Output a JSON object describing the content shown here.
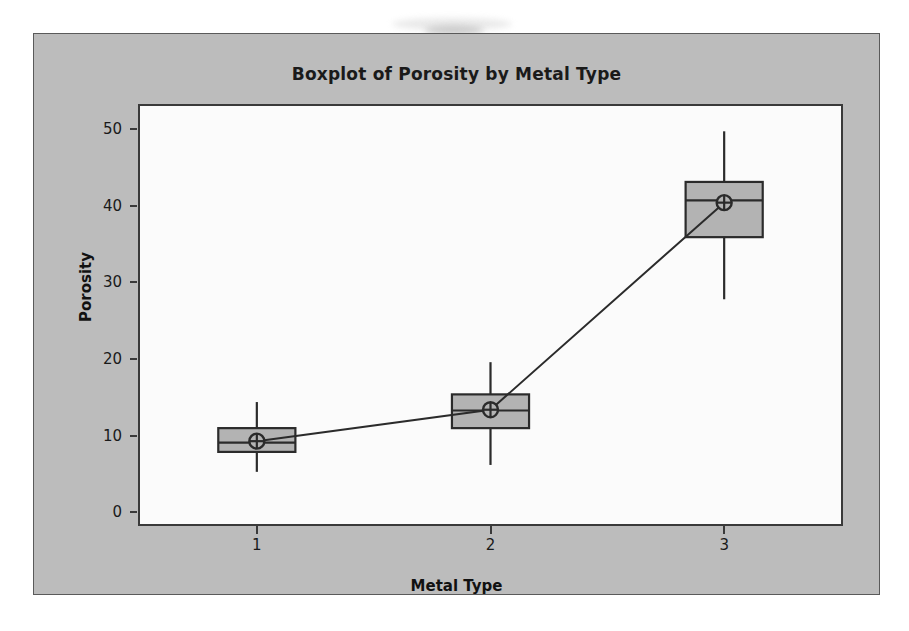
{
  "chart_data": {
    "type": "box",
    "title": "Boxplot of Porosity by Metal Type",
    "xlabel": "Metal Type",
    "ylabel": "Porosity",
    "categories": [
      "1",
      "2",
      "3"
    ],
    "ylim": [
      -1.5,
      53
    ],
    "yticks": [
      0,
      10,
      20,
      30,
      40,
      50
    ],
    "ytick_labels": [
      "0",
      "10",
      "20",
      "30",
      "40",
      "50"
    ],
    "grid": false,
    "legend": "none",
    "box_fill_color": "#b3b3b3",
    "box_edge_color": "#2b2b2b",
    "mean_connect_line": true,
    "mean_symbol": "circle-with-crosshair",
    "boxes": [
      {
        "category": "1",
        "whisker_low": 5.3,
        "q1": 7.9,
        "median": 9.1,
        "q3": 11.0,
        "whisker_high": 14.4,
        "mean": 9.3
      },
      {
        "category": "2",
        "whisker_low": 6.2,
        "q1": 11.0,
        "median": 13.3,
        "q3": 15.4,
        "whisker_high": 19.6,
        "mean": 13.4
      },
      {
        "category": "3",
        "whisker_low": 27.8,
        "q1": 35.9,
        "median": 40.7,
        "q3": 43.1,
        "whisker_high": 49.7,
        "mean": 40.4
      }
    ],
    "means_series": {
      "name": "Means",
      "x": [
        "1",
        "2",
        "3"
      ],
      "values": [
        9.3,
        13.4,
        40.4
      ]
    }
  }
}
